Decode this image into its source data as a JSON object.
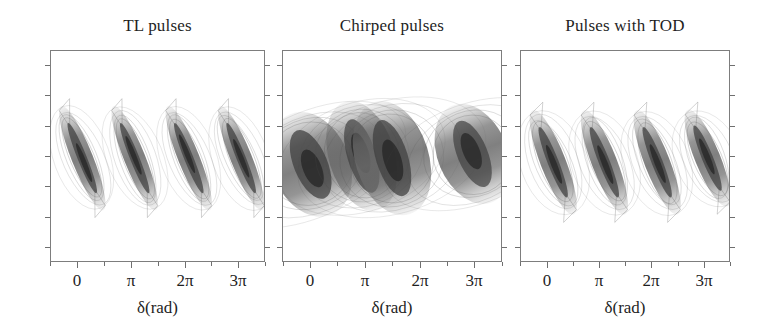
{
  "figure": {
    "background": "#ffffff",
    "axis_color": "#7d7d7d",
    "text_color": "#1f1f1f",
    "contour_color": "#4a4a4a",
    "fill_color": "#6b6b6b"
  },
  "panels": [
    {
      "id": "tl-pulses",
      "title": "TL pulses",
      "xlabel": "δ(rad)",
      "xticklabels": [
        "0",
        "π",
        "2π",
        "3π"
      ],
      "xtick_values": [
        0,
        3.1416,
        6.2832,
        9.4248
      ],
      "xlim": [
        -1.6,
        11.0
      ],
      "ylim": [
        0,
        1
      ],
      "n_xminor": 4,
      "n_yticks": 7,
      "yticklabels": []
    },
    {
      "id": "chirped-pulses",
      "title": "Chirped pulses",
      "xlabel": "δ(rad)",
      "xticklabels": [
        "0",
        "π",
        "2π",
        "3π"
      ],
      "xtick_values": [
        0,
        3.1416,
        6.2832,
        9.4248
      ],
      "xlim": [
        -1.6,
        11.0
      ],
      "ylim": [
        0,
        1
      ],
      "n_xminor": 4,
      "n_yticks": 7,
      "yticklabels": []
    },
    {
      "id": "pulses-with-tod",
      "title": "Pulses with TOD",
      "xlabel": "δ(rad)",
      "xticklabels": [
        "0",
        "π",
        "2π",
        "3π"
      ],
      "xtick_values": [
        0,
        3.1416,
        6.2832,
        9.4248
      ],
      "xlim": [
        -1.6,
        11.0
      ],
      "ylim": [
        0,
        1
      ],
      "n_xminor": 4,
      "n_yticks": 7,
      "yticklabels": []
    }
  ],
  "chart_data": [
    {
      "type": "heatmap",
      "title": "TL pulses",
      "xlabel": "δ(rad)",
      "ylabel": "",
      "xlim": [
        -1.6,
        11.0
      ],
      "ylim": [
        0,
        1
      ],
      "xticklabels": [
        "0",
        "π",
        "2π",
        "3π"
      ],
      "xtick_values": [
        0,
        3.1416,
        6.2832,
        9.4248
      ],
      "grid": false,
      "legend": "none",
      "description": "Four narrow diagonal streaks repeating every 2pi, each descending from upper-left to lower-right, dark narrow core with faint outer contour.",
      "features": [
        {
          "x_start": -1.1,
          "y_start": 0.76,
          "x_end": 1.6,
          "y_end": 0.22,
          "width": 0.055,
          "peak": 1.0
        },
        {
          "x_start": 2.0,
          "y_start": 0.76,
          "x_end": 4.7,
          "y_end": 0.22,
          "width": 0.055,
          "peak": 1.0
        },
        {
          "x_start": 5.2,
          "y_start": 0.76,
          "x_end": 7.9,
          "y_end": 0.22,
          "width": 0.055,
          "peak": 1.0
        },
        {
          "x_start": 8.3,
          "y_start": 0.76,
          "x_end": 11.0,
          "y_end": 0.22,
          "width": 0.055,
          "peak": 1.0
        }
      ]
    },
    {
      "type": "heatmap",
      "title": "Chirped pulses",
      "xlabel": "δ(rad)",
      "ylabel": "",
      "xlim": [
        -1.6,
        11.0
      ],
      "ylim": [
        0,
        1
      ],
      "xticklabels": [
        "0",
        "π",
        "2π",
        "3π"
      ],
      "xtick_values": [
        0,
        3.1416,
        6.2832,
        9.4248
      ],
      "grid": false,
      "legend": "none",
      "description": "Four broad tilted teardrop lobes repeating every 2pi, each with nested closed contours and diffuse dark cores; lobes are much wider than in the TL pulses panel and partly split into two sub-lobes.",
      "features": [
        {
          "x_start": -1.3,
          "y_start": 0.72,
          "x_end": 1.3,
          "y_end": 0.2,
          "width": 0.2,
          "peak": 1.0
        },
        {
          "x_start": 1.9,
          "y_start": 0.78,
          "x_end": 4.0,
          "y_end": 0.22,
          "width": 0.17,
          "peak": 0.95
        },
        {
          "x_start": 3.6,
          "y_start": 0.78,
          "x_end": 5.8,
          "y_end": 0.2,
          "width": 0.19,
          "peak": 1.0
        },
        {
          "x_start": 8.1,
          "y_start": 0.76,
          "x_end": 10.6,
          "y_end": 0.26,
          "width": 0.18,
          "peak": 0.95
        }
      ]
    },
    {
      "type": "heatmap",
      "title": "Pulses with TOD",
      "xlabel": "δ(rad)",
      "ylabel": "",
      "xlim": [
        -1.6,
        11.0
      ],
      "ylim": [
        0,
        1
      ],
      "xticklabels": [
        "0",
        "π",
        "2π",
        "3π"
      ],
      "xtick_values": [
        0,
        3.1416,
        6.2832,
        9.4248
      ],
      "grid": false,
      "legend": "none",
      "description": "Four narrow diagonal streaks repeating every 2pi with a dark core, similar to TL pulses but with forked, frayed tails and a weak satellite streak at the lower left edge.",
      "features": [
        {
          "x_start": -1.0,
          "y_start": 0.74,
          "x_end": 1.7,
          "y_end": 0.2,
          "width": 0.065,
          "peak": 1.0
        },
        {
          "x_start": 2.1,
          "y_start": 0.74,
          "x_end": 4.8,
          "y_end": 0.2,
          "width": 0.065,
          "peak": 1.0
        },
        {
          "x_start": 5.3,
          "y_start": 0.74,
          "x_end": 8.0,
          "y_end": 0.2,
          "width": 0.065,
          "peak": 1.0
        },
        {
          "x_start": 8.4,
          "y_start": 0.74,
          "x_end": 11.0,
          "y_end": 0.24,
          "width": 0.065,
          "peak": 1.0
        }
      ]
    }
  ]
}
